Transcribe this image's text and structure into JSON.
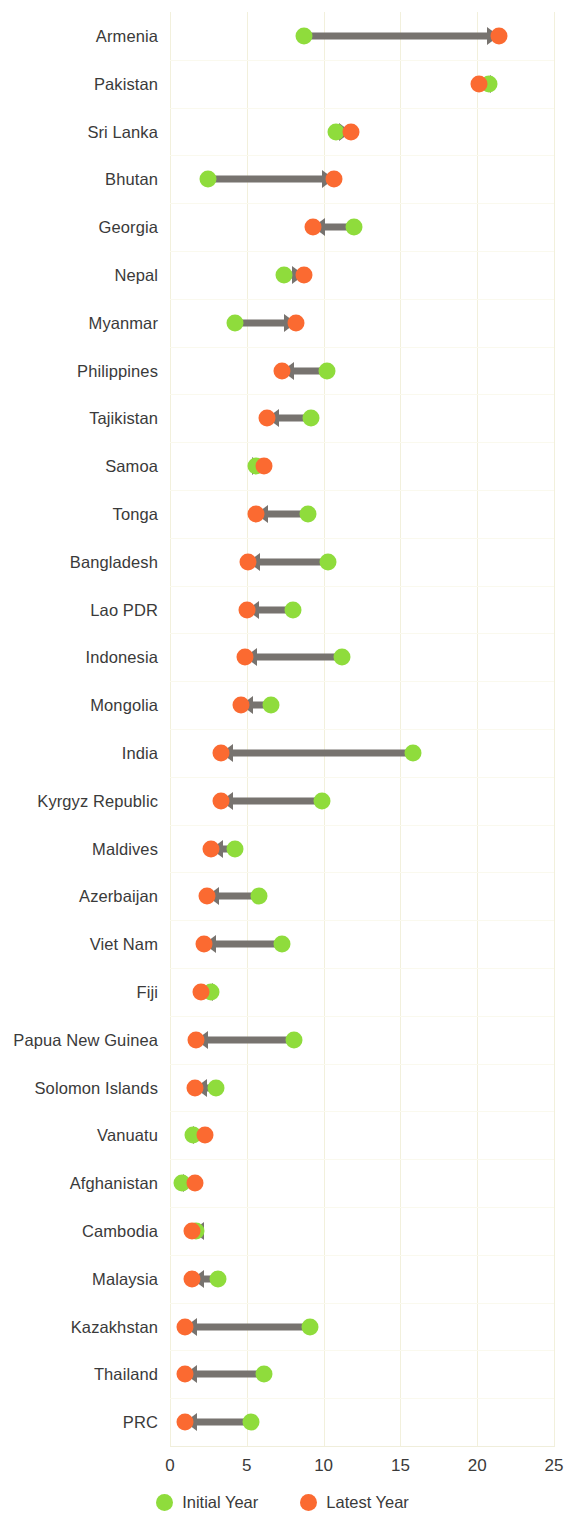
{
  "chart_data": {
    "type": "scatter",
    "subtype": "dumbbell-arrow",
    "title": "",
    "xlabel": "",
    "ylabel": "",
    "xlim": [
      0,
      25
    ],
    "xticks": [
      0,
      5,
      10,
      15,
      20,
      25
    ],
    "xtick_labels": [
      "0",
      "5",
      "10",
      "15",
      "20",
      "25"
    ],
    "grid": true,
    "legend_position": "bottom",
    "colors": {
      "initial": "#8FDC3C",
      "latest": "#FB6A31",
      "arrow": "#77736F",
      "grid": "#F2F0DC",
      "text": "#3A3A3A",
      "background": "#FFFFFF"
    },
    "legend": [
      {
        "label": "Initial Year",
        "color": "#8FDC3C",
        "marker": "circle"
      },
      {
        "label": "Latest Year",
        "color": "#FB6A31",
        "marker": "circle"
      }
    ],
    "series": [
      {
        "name": "Initial Year",
        "color": "#8FDC3C"
      },
      {
        "name": "Latest Year",
        "color": "#FB6A31"
      }
    ],
    "categories": [
      "Armenia",
      "Pakistan",
      "Sri Lanka",
      "Bhutan",
      "Georgia",
      "Nepal",
      "Myanmar",
      "Philippines",
      "Tajikistan",
      "Samoa",
      "Tonga",
      "Bangladesh",
      "Lao PDR",
      "Indonesia",
      "Mongolia",
      "India",
      "Kyrgyz Republic",
      "Maldives",
      "Azerbaijan",
      "Viet Nam",
      "Fiji",
      "Papua New Guinea",
      "Solomon Islands",
      "Vanuatu",
      "Afghanistan",
      "Cambodia",
      "Malaysia",
      "Kazakhstan",
      "Thailand",
      "PRC"
    ],
    "points": [
      {
        "category": "Armenia",
        "initial": 8.7,
        "latest": 21.4
      },
      {
        "category": "Pakistan",
        "initial": 20.8,
        "latest": 20.1
      },
      {
        "category": "Sri Lanka",
        "initial": 10.8,
        "latest": 11.8
      },
      {
        "category": "Bhutan",
        "initial": 2.5,
        "latest": 10.7
      },
      {
        "category": "Georgia",
        "initial": 12.0,
        "latest": 9.3
      },
      {
        "category": "Nepal",
        "initial": 7.4,
        "latest": 8.7
      },
      {
        "category": "Myanmar",
        "initial": 4.2,
        "latest": 8.2
      },
      {
        "category": "Philippines",
        "initial": 10.2,
        "latest": 7.3
      },
      {
        "category": "Tajikistan",
        "initial": 9.2,
        "latest": 6.3
      },
      {
        "category": "Samoa",
        "initial": 5.6,
        "latest": 6.1
      },
      {
        "category": "Tonga",
        "initial": 9.0,
        "latest": 5.6
      },
      {
        "category": "Bangladesh",
        "initial": 10.3,
        "latest": 5.1
      },
      {
        "category": "Lao PDR",
        "initial": 8.0,
        "latest": 5.0
      },
      {
        "category": "Indonesia",
        "initial": 11.2,
        "latest": 4.9
      },
      {
        "category": "Mongolia",
        "initial": 6.6,
        "latest": 4.6
      },
      {
        "category": "India",
        "initial": 15.8,
        "latest": 3.3
      },
      {
        "category": "Kyrgyz Republic",
        "initial": 9.9,
        "latest": 3.3
      },
      {
        "category": "Maldives",
        "initial": 4.2,
        "latest": 2.7
      },
      {
        "category": "Azerbaijan",
        "initial": 5.8,
        "latest": 2.4
      },
      {
        "category": "Viet Nam",
        "initial": 7.3,
        "latest": 2.2
      },
      {
        "category": "Fiji",
        "initial": 2.7,
        "latest": 2.0
      },
      {
        "category": "Papua New Guinea",
        "initial": 8.1,
        "latest": 1.7
      },
      {
        "category": "Solomon Islands",
        "initial": 3.0,
        "latest": 1.6
      },
      {
        "category": "Vanuatu",
        "initial": 1.5,
        "latest": 2.3
      },
      {
        "category": "Afghanistan",
        "initial": 0.8,
        "latest": 1.6
      },
      {
        "category": "Cambodia",
        "initial": 1.7,
        "latest": 1.4
      },
      {
        "category": "Malaysia",
        "initial": 3.1,
        "latest": 1.4
      },
      {
        "category": "Kazakhstan",
        "initial": 9.1,
        "latest": 1.0
      },
      {
        "category": "Thailand",
        "initial": 6.1,
        "latest": 1.0
      },
      {
        "category": "PRC",
        "initial": 5.3,
        "latest": 1.0
      }
    ]
  }
}
